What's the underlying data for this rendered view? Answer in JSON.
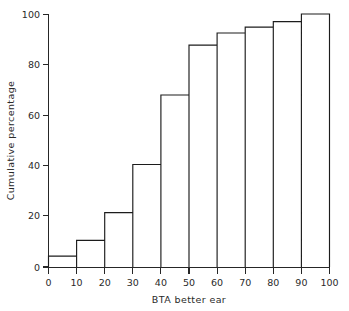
{
  "chart_data": {
    "type": "bar",
    "title": "",
    "subtitle": "",
    "xlabel": "BTA better ear",
    "ylabel": "Cumulative percentage",
    "xlim": [
      0,
      100
    ],
    "ylim": [
      0,
      100
    ],
    "grid": false,
    "legend": false,
    "style": "step-histogram-outline",
    "bin_width": 10,
    "bin_edges": [
      0,
      10,
      20,
      30,
      40,
      50,
      60,
      70,
      80,
      90,
      100
    ],
    "categories": [
      "0-10",
      "10-20",
      "20-30",
      "30-40",
      "40-50",
      "50-60",
      "60-70",
      "70-80",
      "80-90",
      "90-100"
    ],
    "values": [
      4.3,
      10.5,
      21.5,
      40.5,
      68.0,
      87.7,
      92.5,
      94.8,
      97.0,
      100.0
    ],
    "xticks": [
      0,
      10,
      20,
      30,
      40,
      50,
      60,
      70,
      80,
      90,
      100
    ],
    "xtick_labels": [
      "0",
      "10",
      "20",
      "30",
      "40",
      "50",
      "60",
      "70",
      "80",
      "90",
      "100"
    ],
    "yticks": [
      0,
      20,
      40,
      60,
      80,
      100
    ],
    "ytick_labels": [
      "0",
      "20",
      "40",
      "60",
      "80",
      "100"
    ],
    "annotations": []
  },
  "figure": {
    "background_color": "#ffffff",
    "line_color": "#1c1c1c",
    "text_color": "#2a2a2a"
  }
}
